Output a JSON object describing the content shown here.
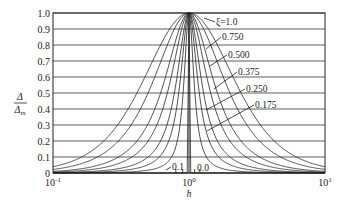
{
  "chart_data": {
    "type": "line",
    "title": "",
    "xlabel": "h",
    "ylabel": "Δ/Δm",
    "xscale": "log",
    "xlim": [
      0.1,
      10
    ],
    "ylim": [
      0,
      1.0
    ],
    "grid": "horizontal",
    "x_ticks": [
      "10^-1",
      "10^0",
      "10^1"
    ],
    "y_ticks": [
      "0",
      "0.1",
      "0.2",
      "0.3",
      "0.4",
      "0.5",
      "0.6",
      "0.7",
      "0.8",
      "0.9",
      "1.0"
    ],
    "legend_position": "inline labels with leader lines",
    "x": [
      0.1,
      0.2,
      0.3,
      0.5,
      0.7,
      0.9,
      1.0,
      1.1,
      1.5,
      2,
      3,
      5,
      10
    ],
    "series": [
      {
        "name": "ξ=1.0",
        "xi": 1.0,
        "values": [
          0.039,
          0.148,
          0.303,
          0.64,
          0.883,
          0.989,
          1.0,
          0.991,
          0.852,
          0.64,
          0.36,
          0.148,
          0.039
        ]
      },
      {
        "name": "0.750",
        "xi": 0.75,
        "values": [
          0.022,
          0.089,
          0.196,
          0.5,
          0.809,
          0.981,
          1.0,
          0.984,
          0.764,
          0.5,
          0.24,
          0.089,
          0.022
        ]
      },
      {
        "name": "0.500",
        "xi": 0.5,
        "values": [
          0.01,
          0.042,
          0.098,
          0.308,
          0.653,
          0.957,
          1.0,
          0.965,
          0.59,
          0.308,
          0.123,
          0.042,
          0.01
        ]
      },
      {
        "name": "0.375",
        "xi": 0.375,
        "values": [
          0.006,
          0.024,
          0.058,
          0.2,
          0.514,
          0.927,
          1.0,
          0.939,
          0.448,
          0.2,
          0.073,
          0.024,
          0.006
        ]
      },
      {
        "name": "0.250",
        "xi": 0.25,
        "values": [
          0.003,
          0.011,
          0.026,
          0.1,
          0.32,
          0.849,
          1.0,
          0.873,
          0.265,
          0.1,
          0.034,
          0.011,
          0.003
        ]
      },
      {
        "name": "0.175",
        "xi": 0.175,
        "values": [
          0.001,
          0.005,
          0.013,
          0.052,
          0.188,
          0.733,
          1.0,
          0.771,
          0.15,
          0.052,
          0.017,
          0.005,
          0.001
        ]
      },
      {
        "name": "0.1",
        "xi": 0.1,
        "values": [
          0.0,
          0.002,
          0.004,
          0.017,
          0.07,
          0.473,
          1.0,
          0.523,
          0.054,
          0.017,
          0.006,
          0.002,
          0.0
        ]
      },
      {
        "name": "0.0",
        "xi": 0.0,
        "values": [
          0,
          0,
          0,
          0,
          0,
          0,
          1.0,
          0,
          0,
          0,
          0,
          0,
          0
        ]
      }
    ],
    "annotations": [
      {
        "text": "ξ=1.0",
        "x": 216,
        "y": 25,
        "line_to": [
          204,
          18
        ]
      },
      {
        "text": "0.750",
        "x": 222,
        "y": 40,
        "line_to": [
          206,
          49
        ]
      },
      {
        "text": "0.500",
        "x": 228,
        "y": 58,
        "line_to": [
          210,
          66
        ]
      },
      {
        "text": "0.375",
        "x": 238,
        "y": 75,
        "line_to": [
          214,
          89
        ]
      },
      {
        "text": "0.250",
        "x": 246,
        "y": 92,
        "line_to": [
          206,
          110
        ]
      },
      {
        "text": "0.175",
        "x": 255,
        "y": 108,
        "line_to": [
          207,
          131
        ]
      },
      {
        "text": "0.1",
        "x": 172,
        "y": 170,
        "line_to": [
          166,
          170
        ]
      },
      {
        "text": "0.0",
        "x": 197,
        "y": 171,
        "line_to": null
      }
    ]
  }
}
